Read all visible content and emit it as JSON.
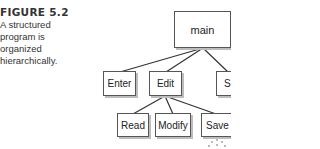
{
  "caption": {
    "label": "FIGURE 5.2",
    "text": "A structured program is organized hierarchically."
  },
  "diagram": {
    "nodes": {
      "main": "main",
      "enter": "Enter",
      "edit": "Edit",
      "s": "S",
      "read": "Read",
      "modify": "Modify",
      "save": "Save"
    },
    "edges": [
      [
        "main",
        "enter"
      ],
      [
        "main",
        "edit"
      ],
      [
        "main",
        "s"
      ],
      [
        "edit",
        "read"
      ],
      [
        "edit",
        "modify"
      ],
      [
        "edit",
        "save"
      ]
    ]
  }
}
